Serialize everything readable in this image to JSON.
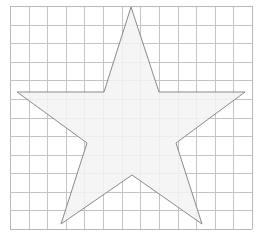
{
  "diagram": {
    "type": "five-pointed-star-on-grid",
    "grid": {
      "left": 10,
      "top": 6,
      "right": 252,
      "bottom": 229,
      "columns": 13,
      "rows": 12,
      "line_color": "#c4c4c4",
      "border_color": "#b8b8b8"
    },
    "star": {
      "fill": "#f3f3f3",
      "stroke": "#8a8a8a",
      "points": [
        [
          131,
          7
        ],
        [
          159,
          92
        ],
        [
          245,
          92
        ],
        [
          176,
          143
        ],
        [
          202,
          224
        ],
        [
          132,
          175
        ],
        [
          61,
          224
        ],
        [
          87,
          143
        ],
        [
          17,
          92
        ],
        [
          104,
          92
        ]
      ]
    }
  }
}
